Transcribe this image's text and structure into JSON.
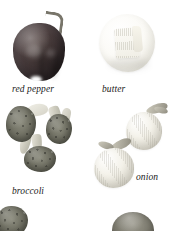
{
  "page": {
    "background_color": "#ffffff",
    "caption_color": "#1a1a1a"
  },
  "figure": {
    "items": [
      {
        "id": "red-pepper",
        "caption": "red pepper",
        "column": "left",
        "row": 1,
        "visible": "full",
        "dominant_color": "#45393a"
      },
      {
        "id": "butter",
        "caption": "butter",
        "column": "right",
        "row": 1,
        "visible": "full",
        "dominant_color": "#f5f3ea"
      },
      {
        "id": "broccoli",
        "caption": "broccoli",
        "column": "left",
        "row": 2,
        "visible": "full",
        "dominant_color": "#6e6e61"
      },
      {
        "id": "onion",
        "caption": "onion",
        "column": "right",
        "row": 2,
        "visible": "full",
        "dominant_color": "#e2dfd3"
      },
      {
        "id": "bottom-left-item",
        "caption": "",
        "column": "left",
        "row": 3,
        "visible": "cropped",
        "dominant_color": "#7e7c70"
      },
      {
        "id": "bottom-right-item",
        "caption": "",
        "column": "right",
        "row": 3,
        "visible": "cropped",
        "dominant_color": "#7e7c70"
      }
    ]
  }
}
